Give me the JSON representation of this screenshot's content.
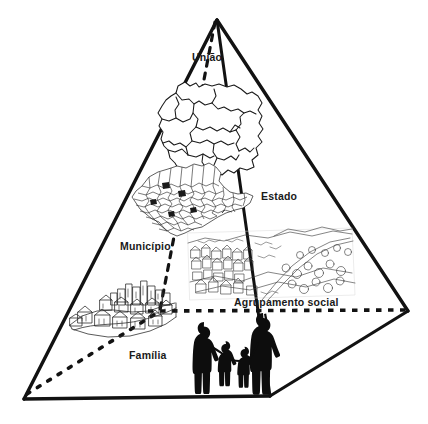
{
  "figure": {
    "type": "diagram",
    "shape": "pyramid",
    "background_color": "#ffffff",
    "line_color": "#111111"
  },
  "labels": {
    "uniao": "União",
    "estado": "Estado",
    "municipio": "Município",
    "agrupamento_social": "Agrupamento social",
    "familia": "Família"
  },
  "levels": [
    {
      "label": "União",
      "illustration": "brazil-map",
      "order": 1
    },
    {
      "label": "Estado",
      "illustration": "state-map",
      "order": 2
    },
    {
      "label": "Município",
      "illustration": "municipality-map",
      "order": 3
    },
    {
      "label": "Agrupamento social",
      "illustration": "city-sketch",
      "order": 4
    },
    {
      "label": "Família",
      "illustration": "family-silhouette",
      "order": 5
    }
  ],
  "illustrations": {
    "brazil_map": "brazil-map-illustration",
    "state_map": "state-municipalities-map-illustration",
    "village": "village-sketch-illustration",
    "cityscape": "cityscape-sketch-illustration",
    "family": "family-silhouette-illustration"
  },
  "geometry": {
    "apex": [
      217,
      20
    ],
    "bottom_left": [
      24,
      399
    ],
    "bottom_front": [
      270,
      396
    ],
    "right_vertex": [
      408,
      311
    ]
  }
}
